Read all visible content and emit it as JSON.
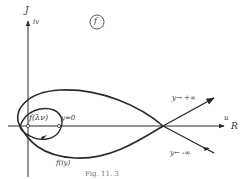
{
  "figure": {
    "panel_label": "f",
    "caption": "Fig. 11. 3"
  },
  "axes": {
    "vertical_label": "J",
    "vertical_sublabel": "iv",
    "horizontal_label": "u",
    "horizontal_sublabel": "R"
  },
  "curve_labels": {
    "point_label": "f(λν)",
    "y_zero": "y=0",
    "curve_name": "f(iy)",
    "y_plus_inf": "y→ +∞",
    "y_minus_inf": "y← -∞"
  },
  "colors": {
    "ink": "#2a2a2a",
    "background": "#ffffff"
  }
}
